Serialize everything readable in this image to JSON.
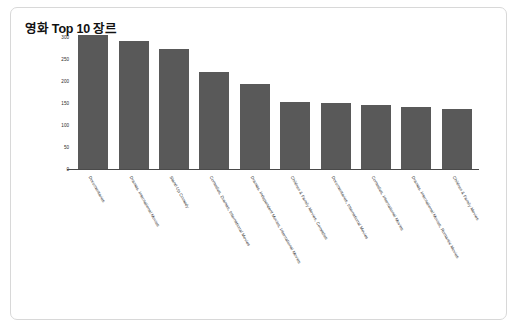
{
  "card": {
    "background": "#ffffff",
    "border_color": "#d8d8d8"
  },
  "chart_data": {
    "type": "bar",
    "title": "영화 Top 10 장르",
    "xlabel": "",
    "ylabel": "",
    "ylim": [
      0,
      300
    ],
    "yticks": [
      0,
      50,
      100,
      150,
      200,
      250,
      300
    ],
    "ytick_labels": [
      "0",
      "50",
      "100",
      "150",
      "200",
      "250",
      "300"
    ],
    "grid": false,
    "legend": "none",
    "bar_color": "#595959",
    "categories": [
      "Documentaries",
      "Dramas, International Movies",
      "Stand-Up Comedy",
      "Comedies, Dramas, International Movies",
      "Dramas, Independent Movies, International Movies",
      "Children & Family Movies, Comedies",
      "Documentaries, International Movies",
      "Comedies, International Movies",
      "Dramas, International Movies, Romantic Movies",
      "Children & Family Movies"
    ],
    "values": [
      305,
      290,
      273,
      220,
      193,
      152,
      151,
      145,
      141,
      136
    ]
  }
}
